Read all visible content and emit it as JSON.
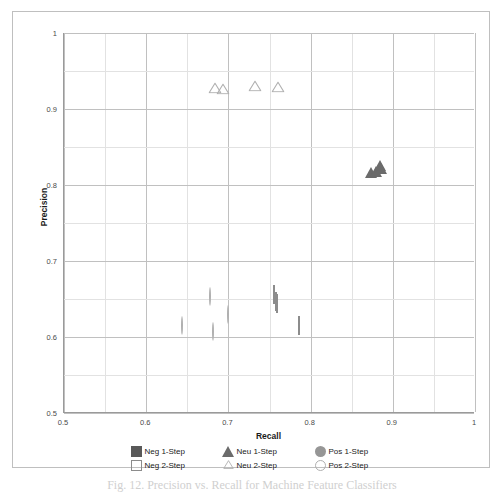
{
  "chart_data": {
    "type": "scatter",
    "title": "",
    "xlabel": "Recall",
    "ylabel": "Precision",
    "xlim": [
      0.5,
      1.0
    ],
    "ylim": [
      0.5,
      1.0
    ],
    "x_ticks": [
      "0.5",
      "0.6",
      "0.7",
      "0.8",
      "0.9",
      "1"
    ],
    "x_tick_values": [
      0.5,
      0.6,
      0.7,
      0.8,
      0.9,
      1.0
    ],
    "y_ticks": [
      "0.5",
      "0.6",
      "0.7",
      "0.8",
      "0.9",
      "1"
    ],
    "y_tick_values": [
      0.5,
      0.6,
      0.7,
      0.8,
      0.9,
      1.0
    ],
    "minor_tick_step": 0.05,
    "grid": true,
    "legend_position": "bottom",
    "series": [
      {
        "name": "Neg 1-Step",
        "marker": "square-filled",
        "color": "#595959",
        "points": [
          {
            "x": 0.71,
            "y": 0.682
          },
          {
            "x": 0.714,
            "y": 0.679
          },
          {
            "x": 0.717,
            "y": 0.676
          },
          {
            "x": 0.712,
            "y": 0.69
          },
          {
            "x": 0.739,
            "y": 0.65
          }
        ]
      },
      {
        "name": "Neu 1-Step",
        "marker": "triangle-filled",
        "color": "#6b6b6b",
        "points": [
          {
            "x": 0.874,
            "y": 0.834
          },
          {
            "x": 0.879,
            "y": 0.836
          },
          {
            "x": 0.884,
            "y": 0.843
          },
          {
            "x": 0.886,
            "y": 0.84
          }
        ]
      },
      {
        "name": "Pos 1-Step",
        "marker": "circle-filled",
        "color": "#969696",
        "points": [
          {
            "x": 0.562,
            "y": 0.7
          },
          {
            "x": 0.605,
            "y": 0.692
          },
          {
            "x": 0.608,
            "y": 0.694
          },
          {
            "x": 0.619,
            "y": 0.7
          }
        ]
      },
      {
        "name": "Neg 2-Step",
        "marker": "square-open",
        "color": "#8c8c8c",
        "points": [
          {
            "x": 0.756,
            "y": 0.655
          },
          {
            "x": 0.758,
            "y": 0.646
          },
          {
            "x": 0.759,
            "y": 0.643
          },
          {
            "x": 0.786,
            "y": 0.614
          }
        ]
      },
      {
        "name": "Neu 2-Step",
        "marker": "triangle-open",
        "color": "#b0b0b0",
        "points": [
          {
            "x": 0.684,
            "y": 0.928
          },
          {
            "x": 0.694,
            "y": 0.926
          },
          {
            "x": 0.732,
            "y": 0.93
          },
          {
            "x": 0.76,
            "y": 0.929
          }
        ]
      },
      {
        "name": "Pos 2-Step",
        "marker": "circle-open",
        "color": "#b0b0b0",
        "points": [
          {
            "x": 0.644,
            "y": 0.614
          },
          {
            "x": 0.678,
            "y": 0.652
          },
          {
            "x": 0.681,
            "y": 0.606
          },
          {
            "x": 0.699,
            "y": 0.629
          }
        ]
      }
    ]
  },
  "legend": {
    "rows": [
      [
        {
          "label": "Neg 1-Step",
          "marker": "square-filled",
          "color": "#595959"
        },
        {
          "label": "Neu 1-Step",
          "marker": "triangle-filled",
          "color": "#6b6b6b"
        },
        {
          "label": "Pos 1-Step",
          "marker": "circle-filled",
          "color": "#969696"
        }
      ],
      [
        {
          "label": "Neg 2-Step",
          "marker": "square-open",
          "color": "#8c8c8c"
        },
        {
          "label": "Neu 2-Step",
          "marker": "triangle-open",
          "color": "#b0b0b0"
        },
        {
          "label": "Pos 2-Step",
          "marker": "circle-open",
          "color": "#b0b0b0"
        }
      ]
    ]
  },
  "caption": "Fig. 12. Precision vs. Recall for Machine Feature Classifiers"
}
